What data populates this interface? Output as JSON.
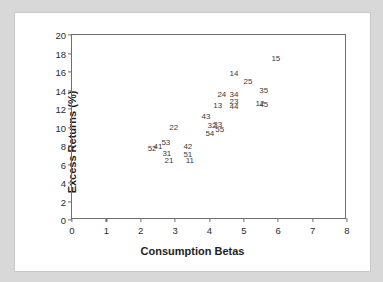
{
  "chart_data": {
    "type": "scatter",
    "title": "",
    "xlabel": "Consumption Betas",
    "ylabel": "Excess Returns (%)",
    "xlim": [
      0,
      8
    ],
    "ylim": [
      0,
      20
    ],
    "xticks": [
      "0",
      "1",
      "2",
      "3",
      "4",
      "5",
      "6",
      "7",
      "8"
    ],
    "yticks": [
      "0",
      "2",
      "4",
      "6",
      "8",
      "10",
      "12",
      "14",
      "16",
      "18",
      "20"
    ],
    "grid": false,
    "legend": null,
    "marker_style": "text-label-only",
    "label_color": "#3a3a3a",
    "axis_color": "#6e6e6e",
    "points": [
      {
        "label": "52",
        "x": 2.33,
        "y": 7.68
      },
      {
        "label": "41",
        "x": 2.5,
        "y": 7.89
      },
      {
        "label": "53",
        "x": 2.73,
        "y": 8.32
      },
      {
        "label": "31",
        "x": 2.76,
        "y": 7.14
      },
      {
        "label": "21",
        "x": 2.82,
        "y": 6.38
      },
      {
        "label": "22",
        "x": 2.96,
        "y": 9.95
      },
      {
        "label": "42",
        "x": 3.37,
        "y": 7.84
      },
      {
        "label": "51",
        "x": 3.37,
        "y": 7.08
      },
      {
        "label": "11",
        "x": 3.43,
        "y": 6.38
      },
      {
        "label": "43",
        "x": 3.9,
        "y": 11.14
      },
      {
        "label": "54",
        "x": 4.01,
        "y": 9.3
      },
      {
        "label": "32",
        "x": 4.07,
        "y": 10.11
      },
      {
        "label": "33",
        "x": 4.24,
        "y": 10.27
      },
      {
        "label": "55",
        "x": 4.3,
        "y": 9.68
      },
      {
        "label": "13",
        "x": 4.24,
        "y": 12.32
      },
      {
        "label": "24",
        "x": 4.36,
        "y": 13.51
      },
      {
        "label": "34",
        "x": 4.71,
        "y": 13.51
      },
      {
        "label": "23",
        "x": 4.71,
        "y": 12.81
      },
      {
        "label": "44",
        "x": 4.71,
        "y": 12.22
      },
      {
        "label": "14",
        "x": 4.71,
        "y": 15.78
      },
      {
        "label": "25",
        "x": 5.12,
        "y": 14.97
      },
      {
        "label": "35",
        "x": 5.58,
        "y": 13.95
      },
      {
        "label": "12",
        "x": 5.47,
        "y": 12.49
      },
      {
        "label": "45",
        "x": 5.58,
        "y": 12.38
      },
      {
        "label": "15",
        "x": 5.93,
        "y": 17.41
      }
    ]
  }
}
